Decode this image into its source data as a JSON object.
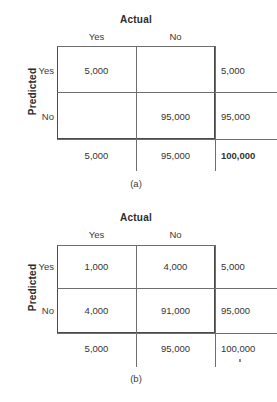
{
  "figures": [
    {
      "id": "a",
      "caption": "(a)",
      "column_axis_title": "Actual",
      "row_axis_title": "Predicted",
      "column_headers": [
        "Yes",
        "No"
      ],
      "row_headers": [
        "Yes",
        "No"
      ],
      "rows": [
        {
          "label": "Yes",
          "cells": [
            "5,000",
            ""
          ],
          "row_total": "5,000"
        },
        {
          "label": "No",
          "cells": [
            "",
            "95,000"
          ],
          "row_total": "95,000"
        }
      ],
      "column_totals": [
        "5,000",
        "95,000"
      ],
      "grand_total": "100,000",
      "grand_total_bold": true
    },
    {
      "id": "b",
      "caption": "(b)",
      "column_axis_title": "Actual",
      "row_axis_title": "Predicted",
      "column_headers": [
        "Yes",
        "No"
      ],
      "row_headers": [
        "Yes",
        "No"
      ],
      "rows": [
        {
          "label": "Yes",
          "cells": [
            "1,000",
            "4,000"
          ],
          "row_total": "5,000"
        },
        {
          "label": "No",
          "cells": [
            "4,000",
            "91,000"
          ],
          "row_total": "95,000"
        }
      ],
      "column_totals": [
        "5,000",
        "95,000"
      ],
      "grand_total": "100,000",
      "grand_total_bold": false
    }
  ],
  "colors": {
    "background": "#ffffff",
    "box_border": "#4a4a4a",
    "rule": "#6e6e6e",
    "text": "#333333"
  }
}
